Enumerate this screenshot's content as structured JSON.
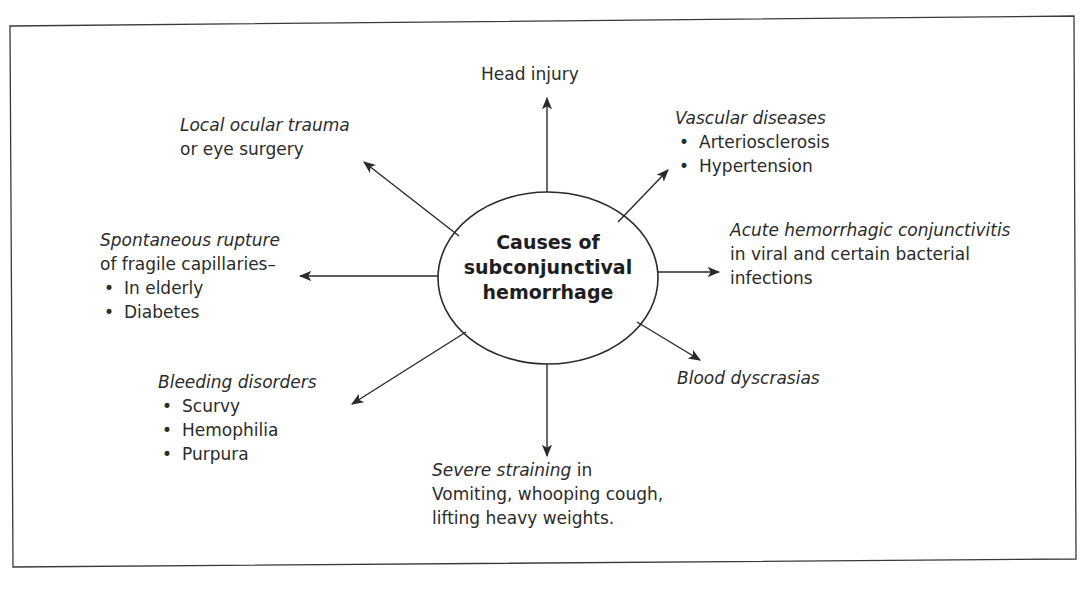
{
  "diagram": {
    "type": "mind-map",
    "center": {
      "lines": [
        "Causes of",
        "subconjunctival",
        "hemorrhage"
      ]
    },
    "nodes": {
      "head_injury": {
        "title": "Head injury"
      },
      "local_trauma": {
        "title_italic": "Local ocular trauma",
        "subtitle": "or eye surgery"
      },
      "vascular": {
        "title_italic": "Vascular diseases",
        "items": [
          "Arteriosclerosis",
          "Hypertension"
        ]
      },
      "spontaneous": {
        "title_italic": "Spontaneous rupture",
        "subtitle": "of fragile capillaries–",
        "items": [
          "In elderly",
          "Diabetes"
        ]
      },
      "acute_conj": {
        "title_italic": "Acute hemorrhagic conjunctivitis",
        "lines": [
          "in viral and certain bacterial",
          "infections"
        ]
      },
      "bleeding": {
        "title_italic": "Bleeding disorders",
        "items": [
          "Scurvy",
          "Hemophilia",
          "Purpura"
        ]
      },
      "blood_dys": {
        "title_italic": "Blood dyscrasias"
      },
      "straining": {
        "title_italic": "Severe straining",
        "title_suffix": " in",
        "lines": [
          "Vomiting, whooping cough,",
          "lifting heavy weights."
        ]
      }
    },
    "colors": {
      "line": "#2a2a2a",
      "text": "#2b2b2b",
      "background": "#ffffff"
    }
  }
}
